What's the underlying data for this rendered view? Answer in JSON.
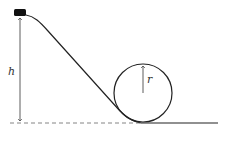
{
  "diagram": {
    "labels": {
      "height": "h",
      "radius": "r"
    },
    "colors": {
      "stroke": "#222222",
      "block": "#111111",
      "dashed": "#666666"
    }
  }
}
